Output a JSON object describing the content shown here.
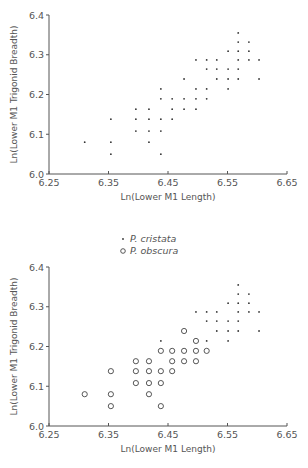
{
  "chart_data": [
    {
      "type": "scatter",
      "title": "",
      "xlabel": "Ln(Lower M1 Length)",
      "ylabel": "Ln(Lower M1 Trigonid Breadth)",
      "xlim": [
        6.25,
        6.65
      ],
      "ylim": [
        6.0,
        6.4
      ],
      "xticks": [
        "6.25",
        "6.35",
        "6.45",
        "6.55",
        "6.65"
      ],
      "yticks": [
        "6.0",
        "6.1",
        "6.2",
        "6.3",
        "6.4"
      ],
      "grid": false,
      "legend": null,
      "series": [
        {
          "name": "all specimens",
          "marker": "dot",
          "points": [
            [
              6.31,
              6.08
            ],
            [
              6.354,
              6.138
            ],
            [
              6.354,
              6.08
            ],
            [
              6.354,
              6.05
            ],
            [
              6.396,
              6.163
            ],
            [
              6.396,
              6.138
            ],
            [
              6.396,
              6.108
            ],
            [
              6.418,
              6.163
            ],
            [
              6.418,
              6.138
            ],
            [
              6.418,
              6.108
            ],
            [
              6.418,
              6.08
            ],
            [
              6.438,
              6.214
            ],
            [
              6.438,
              6.189
            ],
            [
              6.438,
              6.138
            ],
            [
              6.438,
              6.108
            ],
            [
              6.438,
              6.05
            ],
            [
              6.457,
              6.189
            ],
            [
              6.457,
              6.163
            ],
            [
              6.457,
              6.138
            ],
            [
              6.477,
              6.239
            ],
            [
              6.477,
              6.189
            ],
            [
              6.477,
              6.163
            ],
            [
              6.497,
              6.287
            ],
            [
              6.497,
              6.214
            ],
            [
              6.497,
              6.189
            ],
            [
              6.497,
              6.163
            ],
            [
              6.515,
              6.287
            ],
            [
              6.515,
              6.264
            ],
            [
              6.515,
              6.214
            ],
            [
              6.515,
              6.189
            ],
            [
              6.532,
              6.287
            ],
            [
              6.532,
              6.264
            ],
            [
              6.532,
              6.239
            ],
            [
              6.551,
              6.309
            ],
            [
              6.551,
              6.264
            ],
            [
              6.551,
              6.239
            ],
            [
              6.551,
              6.214
            ],
            [
              6.568,
              6.355
            ],
            [
              6.568,
              6.332
            ],
            [
              6.568,
              6.309
            ],
            [
              6.568,
              6.287
            ],
            [
              6.568,
              6.264
            ],
            [
              6.568,
              6.239
            ],
            [
              6.586,
              6.332
            ],
            [
              6.586,
              6.309
            ],
            [
              6.586,
              6.287
            ],
            [
              6.603,
              6.287
            ],
            [
              6.603,
              6.239
            ]
          ]
        }
      ]
    },
    {
      "type": "scatter",
      "title": "",
      "xlabel": "Ln(Lower M1 Length)",
      "ylabel": "Ln(Lower M1 Trigonid Breadth)",
      "xlim": [
        6.25,
        6.65
      ],
      "ylim": [
        6.0,
        6.4
      ],
      "xticks": [
        "6.25",
        "6.35",
        "6.45",
        "6.55",
        "6.65"
      ],
      "yticks": [
        "6.0",
        "6.1",
        "6.2",
        "6.3",
        "6.4"
      ],
      "grid": false,
      "legend": {
        "position": "top-center",
        "entries": [
          "P. cristata",
          "P. obscura"
        ]
      },
      "series": [
        {
          "name": "P. cristata",
          "marker": "dot",
          "points": [
            [
              6.438,
              6.214
            ],
            [
              6.497,
              6.287
            ],
            [
              6.515,
              6.287
            ],
            [
              6.515,
              6.264
            ],
            [
              6.515,
              6.214
            ],
            [
              6.532,
              6.287
            ],
            [
              6.532,
              6.264
            ],
            [
              6.532,
              6.239
            ],
            [
              6.551,
              6.309
            ],
            [
              6.551,
              6.264
            ],
            [
              6.551,
              6.239
            ],
            [
              6.551,
              6.214
            ],
            [
              6.568,
              6.355
            ],
            [
              6.568,
              6.332
            ],
            [
              6.568,
              6.309
            ],
            [
              6.568,
              6.287
            ],
            [
              6.568,
              6.264
            ],
            [
              6.568,
              6.239
            ],
            [
              6.586,
              6.332
            ],
            [
              6.586,
              6.309
            ],
            [
              6.586,
              6.287
            ],
            [
              6.603,
              6.287
            ],
            [
              6.603,
              6.239
            ]
          ]
        },
        {
          "name": "P. obscura",
          "marker": "circle",
          "points": [
            [
              6.31,
              6.08
            ],
            [
              6.354,
              6.138
            ],
            [
              6.354,
              6.08
            ],
            [
              6.354,
              6.05
            ],
            [
              6.396,
              6.163
            ],
            [
              6.396,
              6.138
            ],
            [
              6.396,
              6.108
            ],
            [
              6.418,
              6.163
            ],
            [
              6.418,
              6.138
            ],
            [
              6.418,
              6.108
            ],
            [
              6.418,
              6.08
            ],
            [
              6.438,
              6.189
            ],
            [
              6.438,
              6.138
            ],
            [
              6.438,
              6.108
            ],
            [
              6.438,
              6.05
            ],
            [
              6.457,
              6.189
            ],
            [
              6.457,
              6.163
            ],
            [
              6.457,
              6.138
            ],
            [
              6.477,
              6.239
            ],
            [
              6.477,
              6.189
            ],
            [
              6.477,
              6.163
            ],
            [
              6.497,
              6.214
            ],
            [
              6.497,
              6.189
            ],
            [
              6.497,
              6.163
            ],
            [
              6.515,
              6.189
            ]
          ]
        }
      ]
    }
  ],
  "layout": {
    "panels": [
      {
        "x0": 49,
        "x1": 287,
        "yTop": 15,
        "yBottom": 174,
        "xlabelY": 200,
        "ylabelX": 17
      },
      {
        "x0": 49,
        "x1": 287,
        "yTop": 267,
        "yBottom": 426,
        "xlabelY": 452,
        "ylabelX": 17,
        "legendX": 120,
        "legendY": 254
      }
    ]
  }
}
